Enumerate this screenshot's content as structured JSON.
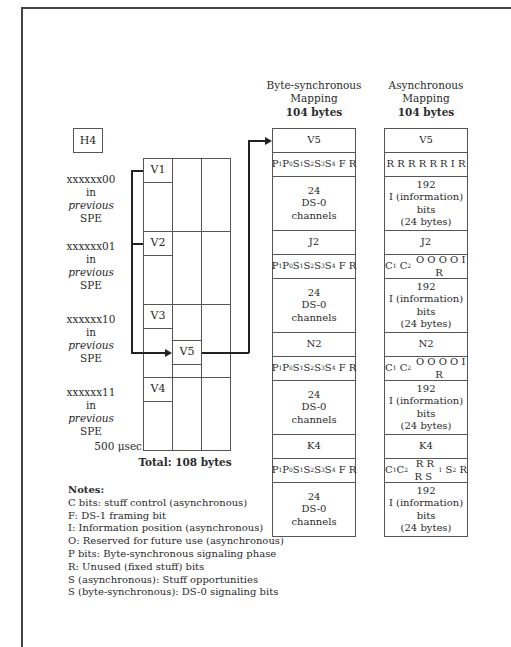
{
  "diagram": {
    "h4_label": "H4",
    "superframe": {
      "rows": [
        {
          "id": "V1",
          "tag_line1": "xxxxxx00",
          "tag_line2": "in",
          "tag_line3": "previous",
          "tag_line4": "SPE"
        },
        {
          "id": "V2",
          "tag_line1": "xxxxxx01",
          "tag_line2": "in",
          "tag_line3": "previous",
          "tag_line4": "SPE"
        },
        {
          "id": "V3",
          "tag_line1": "xxxxxx10",
          "tag_line2": "in",
          "tag_line3": "previous",
          "tag_line4": "SPE"
        },
        {
          "id": "V4",
          "tag_line1": "xxxxxx11",
          "tag_line2": "in",
          "tag_line3": "previous",
          "tag_line4": "SPE"
        }
      ],
      "v5_label": "V5",
      "duration": "500 μsec",
      "total": "Total: 108 bytes"
    },
    "byte_sync": {
      "title_line1": "Byte-synchronous",
      "title_line2": "Mapping",
      "size": "104 bytes",
      "cells": [
        {
          "type": "overhead",
          "text": "V5"
        },
        {
          "type": "bits",
          "text": "P1 P0 S1 S2 S3 S4 F R"
        },
        {
          "type": "payload",
          "line1": "24",
          "line2": "DS-0",
          "line3": "channels"
        },
        {
          "type": "overhead",
          "text": "J2"
        },
        {
          "type": "bits",
          "text": "P1 P0 S1 S2 S3 S4 F R"
        },
        {
          "type": "payload",
          "line1": "24",
          "line2": "DS-0",
          "line3": "channels"
        },
        {
          "type": "overhead",
          "text": "N2"
        },
        {
          "type": "bits",
          "text": "P1 P0 S1 S2 S3 S4 F R"
        },
        {
          "type": "payload",
          "line1": "24",
          "line2": "DS-0",
          "line3": "channels"
        },
        {
          "type": "overhead",
          "text": "K4"
        },
        {
          "type": "bits",
          "text": "P1 P0 S1 S2 S3 S4 F R"
        },
        {
          "type": "payload",
          "line1": "24",
          "line2": "DS-0",
          "line3": "channels"
        }
      ]
    },
    "async": {
      "title_line1": "Asynchronous",
      "title_line2": "Mapping",
      "size": "104 bytes",
      "cells": [
        {
          "type": "overhead",
          "text": "V5"
        },
        {
          "type": "bits",
          "text": "R R R R R R I R"
        },
        {
          "type": "payload",
          "line1": "192",
          "line2": "I (information)",
          "line3": "bits",
          "line4": "(24 bytes)"
        },
        {
          "type": "overhead",
          "text": "J2"
        },
        {
          "type": "bits",
          "text": "C1 C2 O O O O I R"
        },
        {
          "type": "payload",
          "line1": "192",
          "line2": "I (information)",
          "line3": "bits",
          "line4": "(24 bytes)"
        },
        {
          "type": "overhead",
          "text": "N2"
        },
        {
          "type": "bits",
          "text": "C1 C2 O O O O I R"
        },
        {
          "type": "payload",
          "line1": "192",
          "line2": "I (information)",
          "line3": "bits",
          "line4": "(24 bytes)"
        },
        {
          "type": "overhead",
          "text": "K4"
        },
        {
          "type": "bits",
          "text": "C1 C2 R R R S1 S2 R"
        },
        {
          "type": "payload",
          "line1": "192",
          "line2": "I (information)",
          "line3": "bits",
          "line4": "(24 bytes)"
        }
      ]
    },
    "notes": {
      "title": "Notes:",
      "items": [
        "C bits: stuff control (asynchronous)",
        "F: DS-1 framing bit",
        "I: Information position (asynchronous)",
        "O: Reserved for future use (asynchronous)",
        "P bits: Byte-synchronous signaling phase",
        "R: Unused (fixed stuff) bits",
        "S (asynchronous): Stuff opportunities",
        "S (byte-synchronous): DS-0 signaling bits"
      ]
    }
  }
}
